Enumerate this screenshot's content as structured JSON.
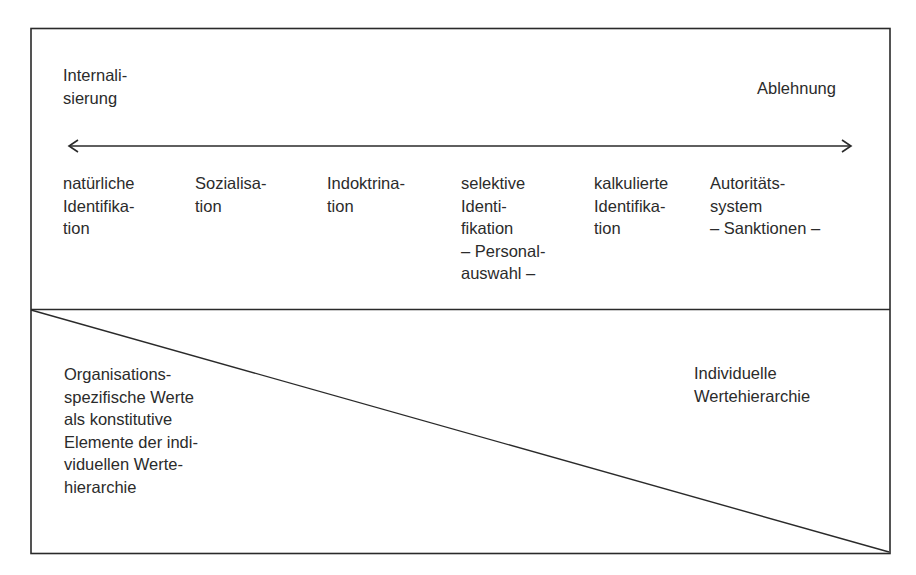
{
  "diagram": {
    "top_section": {
      "left_pole": "Internali-\nsierung",
      "right_pole": "Ablehnung",
      "arrow": "bidirectional",
      "stages": [
        {
          "label": "natürliche\nIdentifika-\ntion"
        },
        {
          "label": "Sozialisa-\ntion"
        },
        {
          "label": "Indoktrina-\ntion"
        },
        {
          "label": "selektive\nIdenti-\nfikation\n– Personal-\nauswahl –"
        },
        {
          "label": "kalkulierte\nIdentifika-\ntion"
        },
        {
          "label": "Autoritäts-\nsystem\n– Sanktionen –"
        }
      ]
    },
    "bottom_section": {
      "left_label": "Organisations-\nspezifische Werte\nals konstitutive\nElemente der indi-\nviduellen Werte-\nhierarchie",
      "right_label": "Individuelle\nWertehierarchie",
      "divider": "diagonal"
    }
  },
  "colors": {
    "line": "#2a2a2a",
    "text": "#2b2b2b",
    "background": "#ffffff"
  }
}
